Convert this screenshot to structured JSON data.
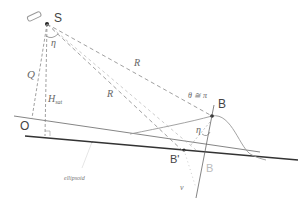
{
  "diagram": {
    "title": "",
    "points": {
      "S": "S",
      "O": "O",
      "B": "B",
      "B_prime": "B'",
      "B_ghost": "B"
    },
    "labels": {
      "eta_top": "η",
      "eta_right": "η",
      "Q": "Q",
      "H": "H",
      "H_sub": "sat",
      "R_upper": "R",
      "R_lower": "R",
      "theta_eq": "θ ≅ π",
      "nu": "ν",
      "ellipsoid": "ellipsoid"
    },
    "colors": {
      "line": "#555555",
      "dashed": "#888888",
      "ground": "#333333",
      "curve": "#999999",
      "ghost_label": "#bbbbbb"
    }
  }
}
